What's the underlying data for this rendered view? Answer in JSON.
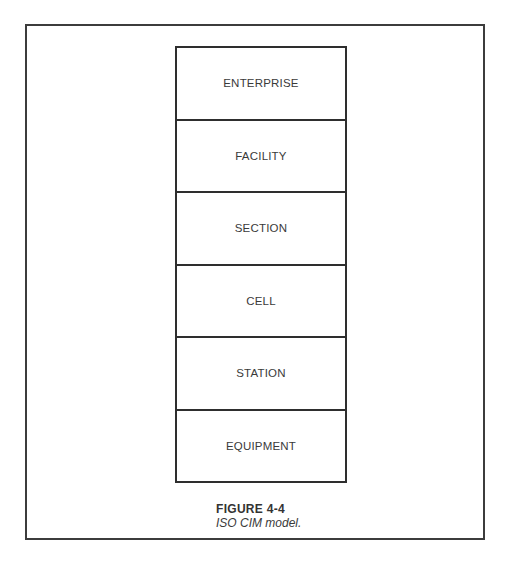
{
  "figure": {
    "number": "FIGURE 4-4",
    "caption": "ISO CIM model."
  },
  "diagram": {
    "type": "layered-stack",
    "levels": [
      {
        "label": "ENTERPRISE"
      },
      {
        "label": "FACILITY"
      },
      {
        "label": "SECTION"
      },
      {
        "label": "CELL"
      },
      {
        "label": "STATION"
      },
      {
        "label": "EQUIPMENT"
      }
    ]
  },
  "colors": {
    "line": "#2e2e2e",
    "text": "#3a3a3a",
    "background": "#ffffff"
  }
}
